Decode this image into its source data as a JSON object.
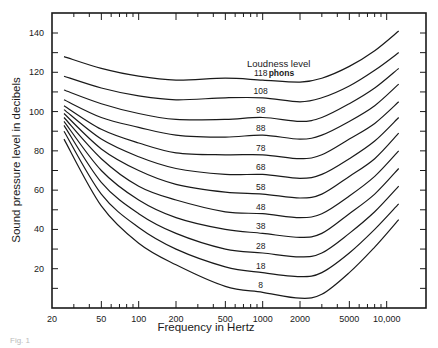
{
  "chart_data": {
    "type": "line",
    "title": "",
    "xlabel": "Frequency in Hertz",
    "ylabel": "Sound pressure level in decibels",
    "x_scale": "log",
    "xlim": [
      20,
      16000
    ],
    "ylim": [
      0,
      147
    ],
    "grid": false,
    "x_ticks": [
      20,
      50,
      100,
      200,
      500,
      1000,
      2000,
      5000,
      10000
    ],
    "x_tick_labels": [
      "20",
      "50",
      "100",
      "200",
      "500",
      "1000",
      "2000",
      "5000",
      "10,000"
    ],
    "y_ticks": [
      20,
      40,
      60,
      80,
      100,
      120,
      140
    ],
    "y_tick_labels": [
      "20",
      "40",
      "60",
      "80",
      "100",
      "120",
      "140"
    ],
    "legend_title": "Loudness level",
    "legend_unit": "phons",
    "x": [
      25,
      50,
      100,
      200,
      500,
      1000,
      2000,
      3000,
      5000,
      8000,
      12500
    ],
    "series": [
      {
        "name": "118 phons",
        "label": "118",
        "values": [
          128,
          122,
          118,
          116,
          117,
          116,
          115,
          117,
          123,
          131,
          141
        ]
      },
      {
        "name": "108 phons",
        "label": "108",
        "values": [
          118,
          112,
          108,
          106,
          107,
          107,
          105,
          107,
          113,
          121,
          130
        ]
      },
      {
        "name": "98 phons",
        "label": "98",
        "values": [
          111,
          104,
          99,
          96,
          96,
          97,
          95,
          97,
          104,
          112,
          122
        ]
      },
      {
        "name": "88 phons",
        "label": "88",
        "values": [
          106,
          97,
          92,
          88,
          87,
          88,
          86,
          88,
          95,
          103,
          114
        ]
      },
      {
        "name": "78 phons",
        "label": "78",
        "values": [
          103,
          91,
          84,
          79,
          78,
          78,
          76,
          78,
          86,
          94,
          105
        ]
      },
      {
        "name": "68 phons",
        "label": "68",
        "values": [
          101,
          86,
          77,
          71,
          68,
          68,
          66,
          68,
          76,
          85,
          97
        ]
      },
      {
        "name": "58 phons",
        "label": "58",
        "values": [
          99,
          81,
          70,
          63,
          59,
          58,
          56,
          58,
          67,
          76,
          89
        ]
      },
      {
        "name": "48 phons",
        "label": "48",
        "values": [
          97,
          76,
          62,
          55,
          49,
          48,
          46,
          48,
          57,
          67,
          80
        ]
      },
      {
        "name": "38 phons",
        "label": "38",
        "values": [
          95,
          70,
          55,
          46,
          40,
          38,
          36,
          38,
          48,
          58,
          71
        ]
      },
      {
        "name": "28 phons",
        "label": "28",
        "values": [
          93,
          64,
          48,
          38,
          30,
          28,
          26,
          28,
          38,
          49,
          62
        ]
      },
      {
        "name": "18 phons",
        "label": "18",
        "values": [
          90,
          58,
          41,
          30,
          21,
          18,
          16,
          18,
          28,
          40,
          53
        ]
      },
      {
        "name": "8 phons",
        "label": "8",
        "values": [
          86,
          52,
          33,
          22,
          11,
          8,
          5,
          7,
          18,
          31,
          45
        ]
      }
    ]
  },
  "caption": "Fig. 1"
}
